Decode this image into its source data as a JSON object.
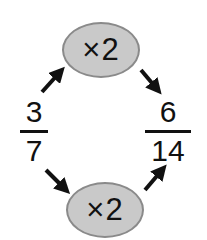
{
  "diagram": {
    "left_fraction": {
      "numerator": "3",
      "denominator": "7"
    },
    "right_fraction": {
      "numerator": "6",
      "denominator": "14"
    },
    "top_operation": "×2",
    "bottom_operation": "×2",
    "colors": {
      "ellipse_fill": "#c9c9c9",
      "ellipse_border": "#8a8a8a",
      "ink": "#111111"
    }
  }
}
